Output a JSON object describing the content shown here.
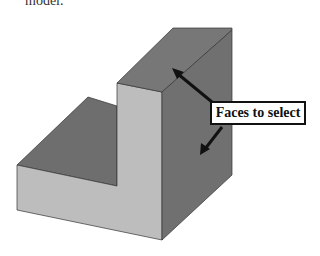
{
  "caption": {
    "text": "model."
  },
  "figure": {
    "label": "Faces to select",
    "colors": {
      "dark_face": "#6e6e6e",
      "top_face": "#777777",
      "light_face": "#bdbdbd",
      "right_face": "#707070",
      "edge": "#333333",
      "arrow": "#111111"
    }
  }
}
